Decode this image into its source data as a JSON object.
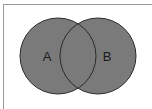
{
  "diagram": {
    "type": "venn",
    "fill_color": "#7a7a7a",
    "stroke_color": "#2a2a2a",
    "label_color": "#1a1a1a",
    "sets": [
      {
        "label": "A",
        "cx": 58,
        "cy": 56,
        "r": 38,
        "label_x": 47,
        "label_y": 61
      },
      {
        "label": "B",
        "cx": 98,
        "cy": 56,
        "r": 38,
        "label_x": 107,
        "label_y": 61
      }
    ]
  }
}
